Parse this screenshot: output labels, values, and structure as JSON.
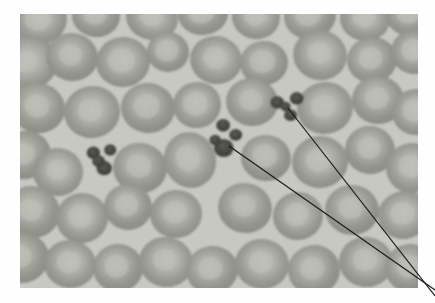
{
  "figure": {
    "type": "micrograph",
    "modality": "light-microscopy",
    "specimen": "peripheral-blood-smear",
    "stain_appearance": "grayscale",
    "caption": "",
    "title": ""
  },
  "panel": {
    "x": 20,
    "y": 14,
    "width": 398,
    "height": 274,
    "background_color": "#c9c9c4",
    "page_background_color": "#ffffff"
  },
  "colors": {
    "background_field": "#c9c9c4",
    "field_light": "#d2d2cd",
    "cell_body": "#a0a09b",
    "cell_body_dark": "#909089",
    "cell_rim": "#8d8d86",
    "cell_pallor": "#c0c0ba",
    "platelet_dark": "#4a4a46",
    "platelet_mid": "#606059",
    "leader_line": "#1a1a1a"
  },
  "annotations": {
    "leader_lines": [
      {
        "name": "leader-line-upper",
        "points": "288,108 435,296",
        "target_label": "platelet-clump-upper-right",
        "stroke_width": 1.2
      },
      {
        "name": "leader-line-lower",
        "points": "229,146 435,290",
        "target_label": "platelet-clump-center",
        "stroke_width": 1.2
      }
    ],
    "crossing_point": {
      "x": 327,
      "y": 182
    }
  },
  "features": {
    "platelet_clumps": [
      {
        "name": "platelet-clump-left",
        "cx": 103,
        "cy": 160,
        "r": 16
      },
      {
        "name": "platelet-clump-center",
        "cx": 226,
        "cy": 140,
        "r": 19
      },
      {
        "name": "platelet-clump-upper-right",
        "cx": 288,
        "cy": 107,
        "r": 17
      }
    ],
    "red_blood_cells": [
      {
        "cx": 40,
        "cy": 20,
        "rx": 27,
        "ry": 24,
        "rot": -8,
        "pallor": 0.5
      },
      {
        "cx": 96,
        "cy": 16,
        "rx": 24,
        "ry": 21,
        "rot": 5,
        "pallor": 0.48
      },
      {
        "cx": 152,
        "cy": 18,
        "rx": 26,
        "ry": 22,
        "rot": 12,
        "pallor": 0.45
      },
      {
        "cx": 203,
        "cy": 14,
        "rx": 25,
        "ry": 21,
        "rot": -5,
        "pallor": 0.52
      },
      {
        "cx": 256,
        "cy": 17,
        "rx": 24,
        "ry": 22,
        "rot": 9,
        "pallor": 0.47
      },
      {
        "cx": 310,
        "cy": 16,
        "rx": 26,
        "ry": 23,
        "rot": -11,
        "pallor": 0.5
      },
      {
        "cx": 365,
        "cy": 19,
        "rx": 25,
        "ry": 22,
        "rot": 7,
        "pallor": 0.46
      },
      {
        "cx": 410,
        "cy": 15,
        "rx": 24,
        "ry": 21,
        "rot": 0,
        "pallor": 0.49
      },
      {
        "cx": 28,
        "cy": 63,
        "rx": 30,
        "ry": 27,
        "rot": -15,
        "pallor": 0.4
      },
      {
        "cx": 72,
        "cy": 57,
        "rx": 26,
        "ry": 24,
        "rot": 8,
        "pallor": 0.44
      },
      {
        "cx": 123,
        "cy": 62,
        "rx": 27,
        "ry": 25,
        "rot": -6,
        "pallor": 0.5
      },
      {
        "cx": 168,
        "cy": 52,
        "rx": 21,
        "ry": 20,
        "rot": 3,
        "pallor": 0.55
      },
      {
        "cx": 216,
        "cy": 60,
        "rx": 26,
        "ry": 24,
        "rot": 10,
        "pallor": 0.45
      },
      {
        "cx": 264,
        "cy": 63,
        "rx": 24,
        "ry": 22,
        "rot": -4,
        "pallor": 0.53
      },
      {
        "cx": 320,
        "cy": 55,
        "rx": 27,
        "ry": 25,
        "rot": 14,
        "pallor": 0.42
      },
      {
        "cx": 372,
        "cy": 60,
        "rx": 25,
        "ry": 23,
        "rot": -9,
        "pallor": 0.48
      },
      {
        "cx": 414,
        "cy": 52,
        "rx": 23,
        "ry": 22,
        "rot": 6,
        "pallor": 0.5
      },
      {
        "cx": 38,
        "cy": 108,
        "rx": 27,
        "ry": 25,
        "rot": 11,
        "pallor": 0.46
      },
      {
        "cx": 92,
        "cy": 112,
        "rx": 28,
        "ry": 26,
        "rot": -7,
        "pallor": 0.44
      },
      {
        "cx": 148,
        "cy": 108,
        "rx": 27,
        "ry": 25,
        "rot": 5,
        "pallor": 0.49
      },
      {
        "cx": 197,
        "cy": 105,
        "rx": 24,
        "ry": 23,
        "rot": -12,
        "pallor": 0.52
      },
      {
        "cx": 252,
        "cy": 102,
        "rx": 26,
        "ry": 24,
        "rot": 8,
        "pallor": 0.45
      },
      {
        "cx": 325,
        "cy": 108,
        "rx": 28,
        "ry": 26,
        "rot": -10,
        "pallor": 0.43
      },
      {
        "cx": 378,
        "cy": 100,
        "rx": 26,
        "ry": 24,
        "rot": 4,
        "pallor": 0.47
      },
      {
        "cx": 416,
        "cy": 112,
        "rx": 24,
        "ry": 23,
        "rot": -3,
        "pallor": 0.51
      },
      {
        "cx": 25,
        "cy": 155,
        "rx": 26,
        "ry": 24,
        "rot": -14,
        "pallor": 0.45
      },
      {
        "cx": 58,
        "cy": 172,
        "rx": 25,
        "ry": 24,
        "rot": 6,
        "pallor": 0.42
      },
      {
        "cx": 140,
        "cy": 168,
        "rx": 27,
        "ry": 25,
        "rot": 9,
        "pallor": 0.48
      },
      {
        "cx": 190,
        "cy": 160,
        "rx": 26,
        "ry": 28,
        "rot": -18,
        "pallor": 0.46
      },
      {
        "cx": 266,
        "cy": 158,
        "rx": 25,
        "ry": 23,
        "rot": 7,
        "pallor": 0.5
      },
      {
        "cx": 320,
        "cy": 162,
        "rx": 28,
        "ry": 26,
        "rot": -6,
        "pallor": 0.44
      },
      {
        "cx": 370,
        "cy": 150,
        "rx": 25,
        "ry": 24,
        "rot": 12,
        "pallor": 0.47
      },
      {
        "cx": 412,
        "cy": 168,
        "rx": 26,
        "ry": 25,
        "rot": -8,
        "pallor": 0.45
      },
      {
        "cx": 32,
        "cy": 212,
        "rx": 28,
        "ry": 26,
        "rot": 10,
        "pallor": 0.43
      },
      {
        "cx": 82,
        "cy": 218,
        "rx": 26,
        "ry": 25,
        "rot": -9,
        "pallor": 0.47
      },
      {
        "cx": 128,
        "cy": 207,
        "rx": 24,
        "ry": 23,
        "rot": 4,
        "pallor": 0.49
      },
      {
        "cx": 176,
        "cy": 214,
        "rx": 26,
        "ry": 24,
        "rot": -5,
        "pallor": 0.46
      },
      {
        "cx": 245,
        "cy": 208,
        "rx": 27,
        "ry": 25,
        "rot": 13,
        "pallor": 0.44
      },
      {
        "cx": 298,
        "cy": 216,
        "rx": 25,
        "ry": 24,
        "rot": -7,
        "pallor": 0.48
      },
      {
        "cx": 352,
        "cy": 210,
        "rx": 27,
        "ry": 25,
        "rot": 6,
        "pallor": 0.45
      },
      {
        "cx": 404,
        "cy": 215,
        "rx": 26,
        "ry": 24,
        "rot": -11,
        "pallor": 0.47
      },
      {
        "cx": 22,
        "cy": 258,
        "rx": 27,
        "ry": 25,
        "rot": -12,
        "pallor": 0.44
      },
      {
        "cx": 70,
        "cy": 264,
        "rx": 26,
        "ry": 24,
        "rot": 8,
        "pallor": 0.46
      },
      {
        "cx": 118,
        "cy": 268,
        "rx": 25,
        "ry": 24,
        "rot": -4,
        "pallor": 0.48
      },
      {
        "cx": 166,
        "cy": 262,
        "rx": 27,
        "ry": 25,
        "rot": 11,
        "pallor": 0.43
      },
      {
        "cx": 212,
        "cy": 270,
        "rx": 26,
        "ry": 24,
        "rot": -8,
        "pallor": 0.47
      },
      {
        "cx": 262,
        "cy": 264,
        "rx": 27,
        "ry": 25,
        "rot": 5,
        "pallor": 0.45
      },
      {
        "cx": 314,
        "cy": 270,
        "rx": 26,
        "ry": 25,
        "rot": -10,
        "pallor": 0.46
      },
      {
        "cx": 366,
        "cy": 262,
        "rx": 27,
        "ry": 25,
        "rot": 9,
        "pallor": 0.44
      },
      {
        "cx": 410,
        "cy": 268,
        "rx": 25,
        "ry": 24,
        "rot": -6,
        "pallor": 0.48
      }
    ]
  }
}
